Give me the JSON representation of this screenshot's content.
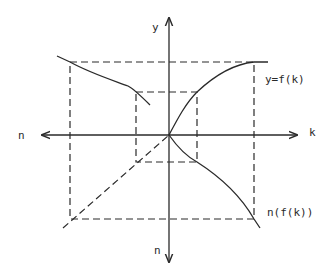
{
  "diagram": {
    "title": "",
    "colors": {
      "ink": "#2a2a2a",
      "background": "#ffffff"
    },
    "axes": {
      "horizontal": {
        "left_label": "n",
        "right_label": "k"
      },
      "vertical": {
        "top_label": "y",
        "bottom_label": "n"
      }
    },
    "curves": {
      "production_function": {
        "label": "y=f(k)"
      },
      "composite_function": {
        "label": "n(f(k))"
      },
      "inverse_curve": {
        "label": ""
      }
    },
    "guides": {
      "outer_rectangle": "dashed",
      "inner_rectangle": "dashed",
      "diagonal_45": "dashed"
    }
  }
}
